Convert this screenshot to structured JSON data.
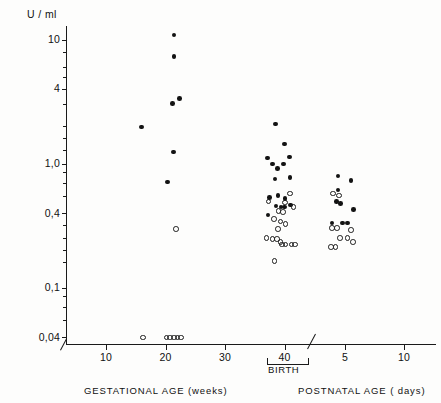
{
  "chart_data": {
    "type": "scatter",
    "title": "",
    "ylabel": "U / ml",
    "yscale": "log",
    "ytick_labels": [
      "10",
      "4",
      "1,0",
      "0,4",
      "0,1",
      "0,04"
    ],
    "ytick_values": [
      10,
      4,
      1.0,
      0.4,
      0.1,
      0.04
    ],
    "ylim": [
      0.035,
      13
    ],
    "grid": false,
    "legend_position": "none",
    "axis_break": true,
    "x_sections": [
      {
        "name": "gestational",
        "xlabel": "GESTATIONAL  AGE (weeks)",
        "tick_labels": [
          "10",
          "20",
          "30",
          "40"
        ],
        "tick_values": [
          10,
          20,
          30,
          40
        ],
        "unit": "weeks"
      },
      {
        "name": "postnatal",
        "xlabel": "POSTNATAL  AGE ( days)",
        "tick_labels": [
          "5",
          "10"
        ],
        "tick_values": [
          5,
          10
        ],
        "unit": "days"
      }
    ],
    "annotations": [
      {
        "text": "BIRTH",
        "at_x": 40,
        "section": "gestational"
      }
    ],
    "series": [
      {
        "name": "filled-circles",
        "marker": "filled-circle",
        "points": [
          {
            "section": "gestational",
            "x": 16.0,
            "y": 2.0
          },
          {
            "section": "gestational",
            "x": 21.4,
            "y": 11.0
          },
          {
            "section": "gestational",
            "x": 21.4,
            "y": 7.4
          },
          {
            "section": "gestational",
            "x": 21.2,
            "y": 3.1
          },
          {
            "section": "gestational",
            "x": 22.4,
            "y": 3.4
          },
          {
            "section": "gestational",
            "x": 21.3,
            "y": 1.25
          },
          {
            "section": "gestational",
            "x": 20.3,
            "y": 0.72
          },
          {
            "section": "gestational",
            "x": 38.5,
            "y": 2.1
          },
          {
            "section": "gestational",
            "x": 40.0,
            "y": 1.45
          },
          {
            "section": "gestational",
            "x": 37.1,
            "y": 1.12
          },
          {
            "section": "gestational",
            "x": 38.0,
            "y": 1.0
          },
          {
            "section": "gestational",
            "x": 38.8,
            "y": 0.92
          },
          {
            "section": "gestational",
            "x": 39.8,
            "y": 1.0
          },
          {
            "section": "gestational",
            "x": 40.8,
            "y": 1.14
          },
          {
            "section": "gestational",
            "x": 38.4,
            "y": 0.76
          },
          {
            "section": "gestational",
            "x": 40.9,
            "y": 0.78
          },
          {
            "section": "gestational",
            "x": 37.5,
            "y": 0.54
          },
          {
            "section": "gestational",
            "x": 38.9,
            "y": 0.56
          },
          {
            "section": "gestational",
            "x": 40.1,
            "y": 0.53
          },
          {
            "section": "gestational",
            "x": 38.6,
            "y": 0.46
          },
          {
            "section": "gestational",
            "x": 39.4,
            "y": 0.45
          },
          {
            "section": "gestational",
            "x": 40.0,
            "y": 0.45
          },
          {
            "section": "gestational",
            "x": 41.0,
            "y": 0.47
          },
          {
            "section": "gestational",
            "x": 37.2,
            "y": 0.39
          },
          {
            "section": "postnatal",
            "x": 4.4,
            "y": 0.8
          },
          {
            "section": "postnatal",
            "x": 5.5,
            "y": 0.74
          },
          {
            "section": "postnatal",
            "x": 4.4,
            "y": 0.62
          },
          {
            "section": "postnatal",
            "x": 4.3,
            "y": 0.5
          },
          {
            "section": "postnatal",
            "x": 4.6,
            "y": 0.48
          },
          {
            "section": "postnatal",
            "x": 5.7,
            "y": 0.43
          },
          {
            "section": "postnatal",
            "x": 3.9,
            "y": 0.335
          },
          {
            "section": "postnatal",
            "x": 4.8,
            "y": 0.335
          },
          {
            "section": "postnatal",
            "x": 5.2,
            "y": 0.335
          }
        ]
      },
      {
        "name": "open-circles",
        "marker": "open-circle",
        "points": [
          {
            "section": "gestational",
            "x": 21.8,
            "y": 0.3
          },
          {
            "section": "gestational",
            "x": 16.2,
            "y": 0.04
          },
          {
            "section": "gestational",
            "x": 20.2,
            "y": 0.04
          },
          {
            "section": "gestational",
            "x": 20.8,
            "y": 0.04
          },
          {
            "section": "gestational",
            "x": 21.4,
            "y": 0.04
          },
          {
            "section": "gestational",
            "x": 22.0,
            "y": 0.04
          },
          {
            "section": "gestational",
            "x": 22.6,
            "y": 0.04
          },
          {
            "section": "gestational",
            "x": 40.9,
            "y": 0.58
          },
          {
            "section": "gestational",
            "x": 37.3,
            "y": 0.5
          },
          {
            "section": "gestational",
            "x": 40.1,
            "y": 0.49
          },
          {
            "section": "gestational",
            "x": 41.5,
            "y": 0.45
          },
          {
            "section": "gestational",
            "x": 39.0,
            "y": 0.42
          },
          {
            "section": "gestational",
            "x": 39.7,
            "y": 0.41
          },
          {
            "section": "gestational",
            "x": 38.2,
            "y": 0.36
          },
          {
            "section": "gestational",
            "x": 39.3,
            "y": 0.345
          },
          {
            "section": "gestational",
            "x": 40.2,
            "y": 0.33
          },
          {
            "section": "gestational",
            "x": 38.9,
            "y": 0.3
          },
          {
            "section": "gestational",
            "x": 37.0,
            "y": 0.255
          },
          {
            "section": "gestational",
            "x": 38.0,
            "y": 0.25
          },
          {
            "section": "gestational",
            "x": 38.7,
            "y": 0.25
          },
          {
            "section": "gestational",
            "x": 39.3,
            "y": 0.235
          },
          {
            "section": "gestational",
            "x": 39.6,
            "y": 0.225
          },
          {
            "section": "gestational",
            "x": 40.2,
            "y": 0.225
          },
          {
            "section": "gestational",
            "x": 41.2,
            "y": 0.225
          },
          {
            "section": "gestational",
            "x": 41.8,
            "y": 0.225
          },
          {
            "section": "gestational",
            "x": 38.3,
            "y": 0.165
          },
          {
            "section": "postnatal",
            "x": 4.0,
            "y": 0.58
          },
          {
            "section": "postnatal",
            "x": 4.5,
            "y": 0.56
          },
          {
            "section": "postnatal",
            "x": 3.9,
            "y": 0.305
          },
          {
            "section": "postnatal",
            "x": 4.3,
            "y": 0.305
          },
          {
            "section": "postnatal",
            "x": 5.5,
            "y": 0.295
          },
          {
            "section": "postnatal",
            "x": 4.6,
            "y": 0.255
          },
          {
            "section": "postnatal",
            "x": 5.2,
            "y": 0.255
          },
          {
            "section": "postnatal",
            "x": 5.7,
            "y": 0.235
          },
          {
            "section": "postnatal",
            "x": 3.8,
            "y": 0.215
          },
          {
            "section": "postnatal",
            "x": 4.2,
            "y": 0.215
          }
        ]
      }
    ]
  },
  "axis": {
    "y_unit_label": "U / ml",
    "x_gestational_caption": "GESTATIONAL  AGE (weeks)",
    "x_postnatal_caption": "POSTNATAL  AGE ( days)",
    "birth_label": "BIRTH"
  }
}
